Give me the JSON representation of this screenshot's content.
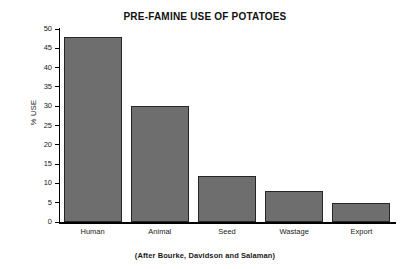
{
  "chart_data": {
    "type": "bar",
    "title": "PRE-FAMINE USE OF POTATOES",
    "xlabel": "",
    "ylabel": "% USE",
    "caption": "(After Bourke, Davidson and Salaman)",
    "categories": [
      "Human",
      "Animal",
      "Seed",
      "Wastage",
      "Export"
    ],
    "values": [
      48,
      30,
      12,
      8,
      5
    ],
    "ylim": [
      0,
      50
    ],
    "yticks": [
      0,
      5,
      10,
      15,
      20,
      25,
      30,
      35,
      40,
      45,
      50
    ],
    "ytick_labels": [
      "0",
      "5",
      "10",
      "15",
      "20",
      "25",
      "30",
      "35",
      "40",
      "45",
      "50"
    ],
    "grid": false,
    "legend": false,
    "bar_color": "#6e6e6e",
    "bar_edge_color": "#262626",
    "axis_color": "#000000",
    "background_color": "#ffffff"
  }
}
